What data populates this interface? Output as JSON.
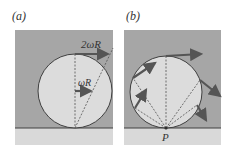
{
  "figure": {
    "panels": [
      {
        "id": "a",
        "label": "(a)",
        "annotations": {
          "top_velocity": "2ωR",
          "center_velocity": "ωR"
        }
      },
      {
        "id": "b",
        "label": "(b)",
        "annotations": {
          "contact_point": "P"
        }
      }
    ],
    "colors": {
      "background_panel": "#a6a6a6",
      "wheel_fill": "#dcdcdc",
      "ground": "#d9d9d9",
      "outline": "#404040",
      "arrow": "#555555"
    }
  }
}
